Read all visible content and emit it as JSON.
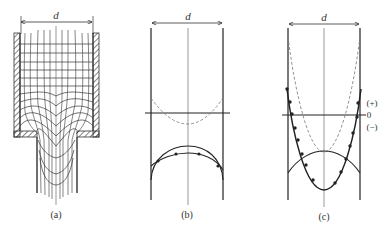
{
  "figure": {
    "dimension_label": "d",
    "panels": [
      {
        "id": "a",
        "caption": "(a)",
        "description": "Grid deformation of material flowing through a die into narrower channel"
      },
      {
        "id": "b",
        "caption": "(b)",
        "description": "Parallel walls with dashed curve above horizontal zero line, solid arc and dotted curve below"
      },
      {
        "id": "c",
        "caption": "(c)",
        "description": "Parallel walls with dashed parabola, solid arc, and dotted parabola crossing zero line"
      }
    ],
    "axis_labels": {
      "plus": "(+)",
      "zero": "0",
      "minus": "(−)"
    }
  },
  "colors": {
    "line": "#2a2a2a",
    "thin": "#555555",
    "dashed": "#777777",
    "background": "#ffffff"
  }
}
